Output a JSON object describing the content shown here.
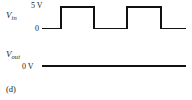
{
  "figure": {
    "panel_label": "(d)",
    "background_color": "#ffffff",
    "trace_color": "#111111"
  },
  "input_signal": {
    "name_main": "V",
    "name_sub": "in",
    "high_label": "5 V",
    "low_label": "0"
  },
  "output_signal": {
    "name_main": "V",
    "name_sub": "out",
    "level_label": "0 V"
  },
  "chart_data": {
    "type": "line",
    "title": "",
    "xlabel": "",
    "ylabel": "",
    "grid": false,
    "legend": "none",
    "xlim": [
      42,
      186
    ],
    "series": [
      {
        "name": "V_in",
        "ylabel": "V_in",
        "ylim": [
          0,
          5
        ],
        "tick_labels": [
          "0",
          "5 V"
        ],
        "tick_values": [
          0,
          5
        ],
        "waveform": "square",
        "pulse_count": 2,
        "points": [
          {
            "x": 42,
            "y": 0
          },
          {
            "x": 61,
            "y": 0
          },
          {
            "x": 61,
            "y": 5
          },
          {
            "x": 94,
            "y": 5
          },
          {
            "x": 94,
            "y": 0
          },
          {
            "x": 127,
            "y": 0
          },
          {
            "x": 127,
            "y": 5
          },
          {
            "x": 161,
            "y": 5
          },
          {
            "x": 161,
            "y": 0
          },
          {
            "x": 186,
            "y": 0
          }
        ]
      },
      {
        "name": "V_out",
        "ylabel": "V_out",
        "ylim": [
          0,
          5
        ],
        "tick_labels": [
          "0 V"
        ],
        "tick_values": [
          0
        ],
        "waveform": "constant",
        "pulse_count": 0,
        "points": [
          {
            "x": 42,
            "y": 0
          },
          {
            "x": 186,
            "y": 0
          }
        ]
      }
    ]
  }
}
